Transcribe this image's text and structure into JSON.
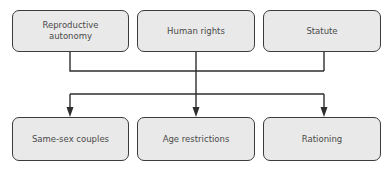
{
  "diagram": {
    "type": "flow",
    "top_nodes": [
      {
        "id": "reproductive-autonomy",
        "label": "Reproductive autonomy"
      },
      {
        "id": "human-rights",
        "label": "Human rights"
      },
      {
        "id": "statute",
        "label": "Statute"
      }
    ],
    "bottom_nodes": [
      {
        "id": "same-sex-couples",
        "label": "Same-sex couples"
      },
      {
        "id": "age-restrictions",
        "label": "Age restrictions"
      },
      {
        "id": "rationing",
        "label": "Rationing"
      }
    ],
    "edges": [
      {
        "from": [
          "reproductive-autonomy",
          "human-rights",
          "statute"
        ],
        "to": [
          "same-sex-couples",
          "age-restrictions",
          "rationing"
        ]
      }
    ],
    "colors": {
      "node_fill": "#e9e9e9",
      "node_border": "#3c3c3c",
      "line": "#2e2e2e",
      "text": "#4a4a4a"
    }
  }
}
